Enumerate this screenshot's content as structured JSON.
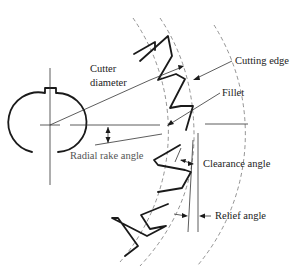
{
  "diagram": {
    "labels": {
      "cutter_diameter_line1": "Cutter",
      "cutter_diameter_line2": "diameter",
      "cutting_edge": "Cutting edge",
      "fillet": "Fillet",
      "radial_rake_angle": "Radial rake angle",
      "clearance_angle": "Clearance angle",
      "relief_angle": "Relief angle"
    },
    "colors": {
      "line": "#1a1a1a",
      "dashed_circle": "#777777",
      "background": "#ffffff"
    }
  }
}
